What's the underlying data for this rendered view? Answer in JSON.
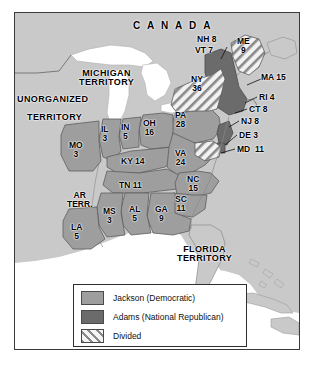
{
  "figure": {
    "type": "historical-election-map",
    "region_labels": [
      {
        "name": "canada",
        "text": "C A N A D A"
      },
      {
        "name": "michigan-territory",
        "text": "MICHIGAN\nTERRITORY"
      },
      {
        "name": "unorganized-territory",
        "text": "UNORGANIZED"
      },
      {
        "name": "unorganized-territory2",
        "text": "TERRITORY"
      },
      {
        "name": "florida-territory",
        "text": "FLORIDA\nTERRITORY"
      },
      {
        "name": "arkansas-territory",
        "text": "AR\nTERR."
      }
    ],
    "states": [
      {
        "abbr": "NH",
        "votes": "8",
        "label": "NH 8",
        "fill": "adams"
      },
      {
        "abbr": "VT",
        "votes": "7",
        "label": "VT 7",
        "fill": "adams"
      },
      {
        "abbr": "ME",
        "votes": "9",
        "label": "ME\n9",
        "fill": "divided"
      },
      {
        "abbr": "MA",
        "votes": "15",
        "label": "MA 15",
        "fill": "adams"
      },
      {
        "abbr": "RI",
        "votes": "4",
        "label": "RI 4",
        "fill": "adams"
      },
      {
        "abbr": "CT",
        "votes": "8",
        "label": "CT 8",
        "fill": "adams"
      },
      {
        "abbr": "NY",
        "votes": "36",
        "label": "NY\n36",
        "fill": "divided"
      },
      {
        "abbr": "NJ",
        "votes": "8",
        "label": "NJ 8",
        "fill": "adams"
      },
      {
        "abbr": "DE",
        "votes": "3",
        "label": "DE 3",
        "fill": "adams"
      },
      {
        "abbr": "MD",
        "votes": "11",
        "label": "MD  11",
        "fill": "divided"
      },
      {
        "abbr": "PA",
        "votes": "28",
        "label": "PA\n28",
        "fill": "jackson"
      },
      {
        "abbr": "OH",
        "votes": "16",
        "label": "OH\n16",
        "fill": "jackson"
      },
      {
        "abbr": "IN",
        "votes": "5",
        "label": "IN\n5",
        "fill": "jackson"
      },
      {
        "abbr": "IL",
        "votes": "3",
        "label": "IL\n3",
        "fill": "jackson"
      },
      {
        "abbr": "MO",
        "votes": "3",
        "label": "MO\n3",
        "fill": "jackson"
      },
      {
        "abbr": "KY",
        "votes": "14",
        "label": "KY 14",
        "fill": "jackson"
      },
      {
        "abbr": "VA",
        "votes": "24",
        "label": "VA\n24",
        "fill": "jackson"
      },
      {
        "abbr": "NC",
        "votes": "15",
        "label": "NC\n15",
        "fill": "jackson"
      },
      {
        "abbr": "SC",
        "votes": "11",
        "label": "SC\n11",
        "fill": "jackson"
      },
      {
        "abbr": "TN",
        "votes": "11",
        "label": "TN 11",
        "fill": "jackson"
      },
      {
        "abbr": "GA",
        "votes": "9",
        "label": "GA\n9",
        "fill": "jackson"
      },
      {
        "abbr": "AL",
        "votes": "5",
        "label": "AL\n5",
        "fill": "jackson"
      },
      {
        "abbr": "MS",
        "votes": "3",
        "label": "MS\n3",
        "fill": "jackson"
      },
      {
        "abbr": "LA",
        "votes": "5",
        "label": "LA\n5",
        "fill": "jackson"
      }
    ],
    "legend": {
      "items": [
        {
          "key": "jackson",
          "label": "Jackson (Democratic)",
          "swatch": "solid-medium-gray"
        },
        {
          "key": "adams",
          "label": "Adams (National Republican)",
          "swatch": "solid-dark-gray"
        },
        {
          "key": "divided",
          "label": "Divided",
          "swatch": "diagonal-hatch"
        }
      ]
    },
    "colors": {
      "jackson": "#9e9e9e",
      "adams": "#6b6b6b",
      "divided_base": "#f2f2f2",
      "divided_hatch": "#7d7d7d",
      "land_background": "#c9c9c9",
      "water": "#ffffff",
      "border": "#3a3a3a"
    }
  }
}
